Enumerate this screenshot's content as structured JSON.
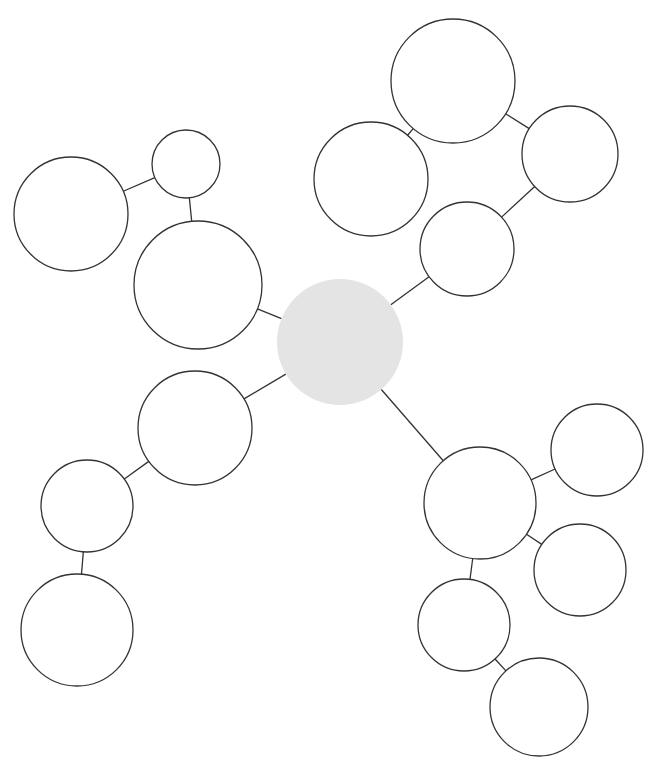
{
  "diagram": {
    "type": "mind-map",
    "width": 655,
    "height": 770,
    "colors": {
      "background": "#ffffff",
      "stroke": "#333333",
      "center_fill": "#e4e4e4",
      "node_fill": "#ffffff"
    },
    "nodes": [
      {
        "id": "center",
        "cx": 340,
        "cy": 342,
        "r": 63,
        "center": true,
        "label": ""
      },
      {
        "id": "ul-hub",
        "cx": 198,
        "cy": 285,
        "r": 64,
        "label": ""
      },
      {
        "id": "ul-small",
        "cx": 186,
        "cy": 164,
        "r": 34,
        "label": ""
      },
      {
        "id": "ul-far",
        "cx": 71,
        "cy": 214,
        "r": 57,
        "label": ""
      },
      {
        "id": "ur-hub",
        "cx": 467,
        "cy": 249,
        "r": 47,
        "label": ""
      },
      {
        "id": "ur-right",
        "cx": 570,
        "cy": 154,
        "r": 48,
        "label": ""
      },
      {
        "id": "ur-top",
        "cx": 453,
        "cy": 81,
        "r": 62,
        "label": ""
      },
      {
        "id": "ur-left",
        "cx": 371,
        "cy": 179,
        "r": 57,
        "label": ""
      },
      {
        "id": "ll-hub",
        "cx": 195,
        "cy": 428,
        "r": 57,
        "label": ""
      },
      {
        "id": "ll-mid",
        "cx": 87,
        "cy": 506,
        "r": 46,
        "label": ""
      },
      {
        "id": "ll-bottom",
        "cx": 77,
        "cy": 630,
        "r": 56,
        "label": ""
      },
      {
        "id": "lr-hub",
        "cx": 480,
        "cy": 503,
        "r": 56,
        "label": ""
      },
      {
        "id": "lr-top",
        "cx": 597,
        "cy": 450,
        "r": 46,
        "label": ""
      },
      {
        "id": "lr-mid",
        "cx": 580,
        "cy": 570,
        "r": 46,
        "label": ""
      },
      {
        "id": "lr-low",
        "cx": 464,
        "cy": 625,
        "r": 46,
        "label": ""
      },
      {
        "id": "lr-bottom",
        "cx": 539,
        "cy": 707,
        "r": 49,
        "label": ""
      }
    ],
    "edges": [
      [
        "center",
        "ul-hub"
      ],
      [
        "ul-hub",
        "ul-small"
      ],
      [
        "ul-small",
        "ul-far"
      ],
      [
        "center",
        "ur-hub"
      ],
      [
        "ur-hub",
        "ur-right"
      ],
      [
        "ur-right",
        "ur-top"
      ],
      [
        "ur-top",
        "ur-left"
      ],
      [
        "center",
        "ll-hub"
      ],
      [
        "ll-hub",
        "ll-mid"
      ],
      [
        "ll-mid",
        "ll-bottom"
      ],
      [
        "center",
        "lr-hub"
      ],
      [
        "lr-hub",
        "lr-top"
      ],
      [
        "lr-hub",
        "lr-mid"
      ],
      [
        "lr-hub",
        "lr-low"
      ],
      [
        "lr-low",
        "lr-bottom"
      ]
    ]
  }
}
